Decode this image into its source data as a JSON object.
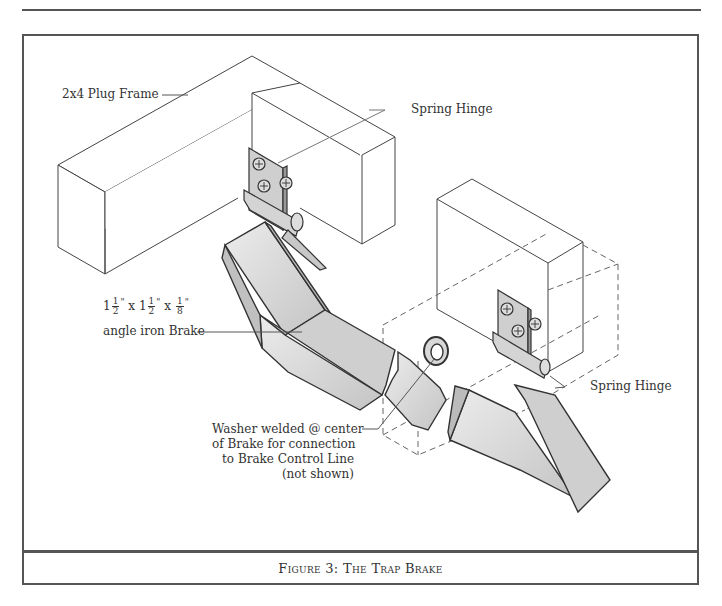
{
  "figure": {
    "caption": "Figure 3:  The Trap Brake"
  },
  "labels": {
    "plug_frame": "2x4 Plug Frame",
    "spring_hinge_top": "Spring Hinge",
    "spring_hinge_right": "Spring Hinge",
    "angle_iron": {
      "dim1_whole": "1",
      "dim1_num": "1",
      "dim1_den": "2",
      "dim1_unit": "\"",
      "x1": "x",
      "dim2_whole": "1",
      "dim2_num": "1",
      "dim2_den": "2",
      "dim2_unit": "\"",
      "x2": "x",
      "dim3_num": "1",
      "dim3_den": "8",
      "dim3_unit": "\"",
      "line2": "angle iron Brake"
    },
    "washer": {
      "line1": "Washer welded @ center",
      "line2": "of Brake for connection",
      "line3": "to Brake Control Line",
      "line4": "(not shown)"
    }
  },
  "colors": {
    "line": "#444444",
    "metal_light": "#e2e2e2",
    "metal_mid": "#cfcfcf",
    "metal_dark": "#bcbcbc",
    "frame_border": "#555555"
  }
}
